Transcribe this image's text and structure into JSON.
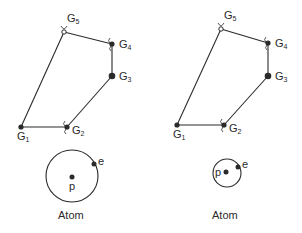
{
  "colors": {
    "background": "#ffffff",
    "ink": "#2a2a2a"
  },
  "panels": [
    {
      "id": "left",
      "nodes": [
        {
          "name": "G",
          "sub": "1",
          "x": 21,
          "y": 127,
          "style": "filled",
          "label_dx": -4,
          "label_dy": 13
        },
        {
          "name": "G",
          "sub": "2",
          "x": 67,
          "y": 127,
          "style": "filled-spring",
          "label_dx": 5,
          "label_dy": 7
        },
        {
          "name": "G",
          "sub": "3",
          "x": 112,
          "y": 76,
          "style": "filled-large",
          "label_dx": 7,
          "label_dy": 4
        },
        {
          "name": "G",
          "sub": "4",
          "x": 112,
          "y": 44,
          "style": "filled-spring",
          "label_dx": 7,
          "label_dy": 4
        },
        {
          "name": "G",
          "sub": "5",
          "x": 64,
          "y": 32,
          "style": "open-spring",
          "label_dx": 3,
          "label_dy": -10
        }
      ],
      "atom": {
        "label": "Atom",
        "circle": {
          "cx": 72,
          "cy": 176,
          "r": 26
        },
        "proton": {
          "x": 72,
          "y": 177,
          "label": "p"
        },
        "electron": {
          "x": 94,
          "y": 164,
          "label": "e"
        },
        "label_x": 58,
        "label_y": 219
      }
    },
    {
      "id": "right",
      "nodes": [
        {
          "name": "G",
          "sub": "1",
          "x": 177,
          "y": 125,
          "style": "filled",
          "label_dx": -4,
          "label_dy": 13
        },
        {
          "name": "G",
          "sub": "2",
          "x": 224,
          "y": 125,
          "style": "filled-spring",
          "label_dx": 5,
          "label_dy": 7
        },
        {
          "name": "G",
          "sub": "3",
          "x": 268,
          "y": 76,
          "style": "filled-large",
          "label_dx": 7,
          "label_dy": 4
        },
        {
          "name": "G",
          "sub": "4",
          "x": 268,
          "y": 43,
          "style": "filled-spring",
          "label_dx": 7,
          "label_dy": 4
        },
        {
          "name": "G",
          "sub": "5",
          "x": 221,
          "y": 29,
          "style": "open-spring",
          "label_dx": 3,
          "label_dy": -10
        }
      ],
      "atom": {
        "label": "Atom",
        "circle": {
          "cx": 227,
          "cy": 173,
          "r": 14
        },
        "proton": {
          "x": 226,
          "y": 172,
          "label": "p"
        },
        "electron": {
          "x": 238,
          "y": 167,
          "label": "e"
        },
        "label_x": 212,
        "label_y": 219
      }
    }
  ],
  "edges": [
    [
      0,
      1
    ],
    [
      1,
      2
    ],
    [
      2,
      3
    ],
    [
      3,
      4
    ],
    [
      4,
      0
    ]
  ]
}
